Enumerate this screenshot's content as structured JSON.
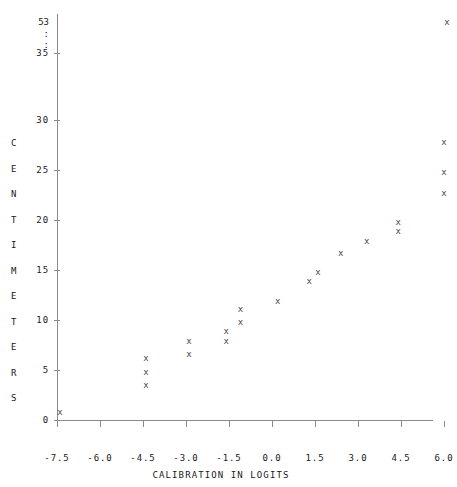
{
  "chart_data": {
    "type": "scatter",
    "title": "",
    "xlabel": "CALIBRATION IN  LOGITS",
    "ylabel": "CENTIMETERS",
    "xlim": [
      -7.5,
      6.5
    ],
    "ylim": [
      0,
      36
    ],
    "grid": false,
    "legend": null,
    "marker": "x",
    "y_axis_break": {
      "break_symbol": ":",
      "top_value": "53",
      "resume_value": "35",
      "note": "y-axis is broken between 35 and 53"
    },
    "xticks": [
      -7.5,
      -6.0,
      -4.5,
      -3.0,
      -1.5,
      0.0,
      1.5,
      3.0,
      4.5,
      6.0
    ],
    "xtick_labels": [
      "-7.5",
      "-6.0",
      "-4.5",
      "-3.0",
      "-1.5",
      "0.0",
      "1.5",
      "3.0",
      "4.5",
      "6.0"
    ],
    "yticks": [
      0,
      5,
      10,
      15,
      20,
      25,
      30,
      35
    ],
    "ytick_labels": [
      "0",
      "5",
      "10",
      "15",
      "20",
      "25",
      "30",
      "35"
    ],
    "ytick_extra_labels": [
      "53",
      ":",
      ":"
    ],
    "ylabel_letters": [
      "C",
      "E",
      "N",
      "T",
      "I",
      "M",
      "E",
      "T",
      "E",
      "R",
      "S"
    ],
    "points": [
      {
        "x": -7.4,
        "y": 0.8
      },
      {
        "x": -4.4,
        "y": 6.2
      },
      {
        "x": -4.4,
        "y": 4.8
      },
      {
        "x": -4.4,
        "y": 3.5
      },
      {
        "x": -2.9,
        "y": 7.9
      },
      {
        "x": -2.9,
        "y": 6.6
      },
      {
        "x": -1.6,
        "y": 8.9
      },
      {
        "x": -1.6,
        "y": 7.9
      },
      {
        "x": -1.1,
        "y": 11.1
      },
      {
        "x": -1.1,
        "y": 9.8
      },
      {
        "x": 0.2,
        "y": 11.9
      },
      {
        "x": 1.3,
        "y": 13.9
      },
      {
        "x": 1.6,
        "y": 14.8
      },
      {
        "x": 2.4,
        "y": 16.7
      },
      {
        "x": 3.3,
        "y": 17.9
      },
      {
        "x": 4.4,
        "y": 19.8
      },
      {
        "x": 4.4,
        "y": 18.9
      },
      {
        "x": 6.0,
        "y": 27.8
      },
      {
        "x": 6.0,
        "y": 24.8
      },
      {
        "x": 6.0,
        "y": 22.7
      },
      {
        "x": 6.1,
        "y": 53.0
      }
    ]
  }
}
